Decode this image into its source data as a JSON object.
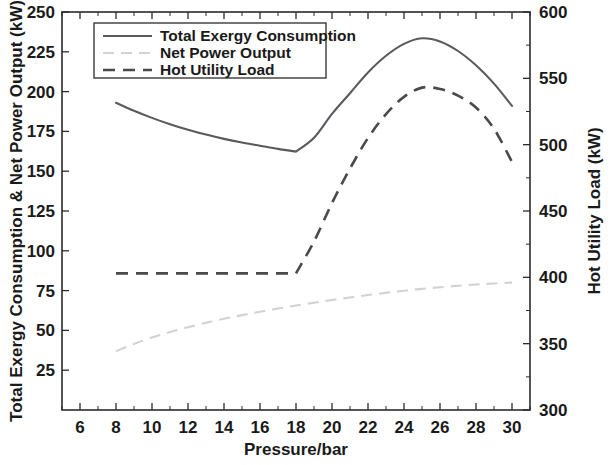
{
  "chart_data": {
    "type": "line",
    "title": "",
    "xlabel": "Pressure/bar",
    "ylabel": "Total Exergy Consumption & Net Power Output (kW)",
    "ylabel_right": "Hot Utility Load (kW)",
    "xlim": [
      5,
      31
    ],
    "ylim": [
      0,
      250
    ],
    "ylim_right": [
      300,
      600
    ],
    "xticks": [
      6,
      8,
      10,
      12,
      14,
      16,
      18,
      20,
      22,
      24,
      26,
      28,
      30
    ],
    "xticklabels": [
      "6",
      "8",
      "10",
      "12",
      "14",
      "16",
      "18",
      "20",
      "22",
      "24",
      "26",
      "28",
      "30"
    ],
    "yticks": [
      25,
      50,
      75,
      100,
      125,
      150,
      175,
      200,
      225,
      250
    ],
    "yticklabels": [
      "25",
      "50",
      "75",
      "100",
      "125",
      "150",
      "175",
      "200",
      "225",
      "250"
    ],
    "yticks_right": [
      300,
      350,
      400,
      450,
      500,
      550,
      600
    ],
    "yticklabels_right": [
      "300",
      "350",
      "400",
      "450",
      "500",
      "550",
      "600"
    ],
    "grid": false,
    "legend_position": "upper left",
    "x": [
      8,
      9,
      10,
      11,
      12,
      13,
      14,
      15,
      16,
      17,
      18,
      19,
      20,
      21,
      22,
      23,
      24,
      25,
      26,
      27,
      28,
      29,
      30
    ],
    "series": [
      {
        "name": "Total Exergy Consumption",
        "axis": "left",
        "style": "solid",
        "color": "#5a5a5e",
        "values": [
          193.0,
          188.0,
          183.5,
          179.5,
          176.0,
          173.0,
          170.3,
          168.0,
          166.0,
          164.0,
          162.3,
          171.0,
          186.0,
          199.0,
          212.0,
          222.5,
          230.0,
          233.5,
          231.5,
          225.5,
          216.5,
          205.0,
          191.0
        ]
      },
      {
        "name": "Net Power Output",
        "axis": "left",
        "style": "dashed",
        "color": "#d2d2d6",
        "values": [
          37.0,
          41.5,
          45.5,
          49.0,
          52.0,
          54.8,
          57.3,
          59.6,
          61.7,
          63.7,
          65.6,
          67.4,
          69.1,
          70.7,
          72.2,
          73.6,
          74.9,
          76.1,
          77.1,
          78.0,
          78.8,
          79.5,
          80.0
        ]
      },
      {
        "name": "Hot Utility Load",
        "axis": "right",
        "style": "dashed",
        "color": "#4a4a4e",
        "values_right": [
          403.0,
          403.0,
          403.0,
          403.0,
          403.0,
          403.0,
          403.0,
          403.0,
          403.0,
          403.0,
          403.0,
          427.0,
          456.0,
          482.0,
          505.0,
          523.0,
          536.0,
          543.0,
          542.0,
          537.0,
          528.0,
          512.0,
          487.0
        ]
      }
    ]
  },
  "legend": {
    "entries": [
      {
        "label": "Total Exergy Consumption",
        "style": "solid"
      },
      {
        "label": "Net Power Output",
        "style": "dashed-light"
      },
      {
        "label": "Hot Utility Load",
        "style": "dashed-dark"
      }
    ]
  },
  "axes": {
    "left_title": "Total Exergy Consumption & Net Power Output (kW)",
    "right_title": "Hot Utility Load (kW)",
    "bottom_title": "Pressure/bar"
  }
}
